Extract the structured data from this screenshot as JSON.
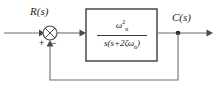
{
  "diagram": {
    "type": "control-block-diagram",
    "background_color": "#ffffff",
    "line_color": "#6e6e6e",
    "block_border_color": "#3c3c3c",
    "text_color": "#1d1d1d"
  },
  "signals": {
    "input_label": "R(s)",
    "output_label": "C(s)"
  },
  "summing_junction": {
    "name": "summing-junction",
    "style": "circle-with-cross",
    "input_sign": "+",
    "feedback_sign": "−",
    "center_x": 50,
    "center_y": 33,
    "radius": 7
  },
  "plant_block": {
    "name": "plant-transfer-function-block",
    "numerator_text": "ωn²",
    "denominator_text": "s(s+2ζωn)",
    "numerator": {
      "symbol": "ω",
      "superscript": "2",
      "subscript": "n"
    },
    "denominator": {
      "leading": "s(s+2",
      "zeta": "ζ",
      "omega": "ω",
      "omega_subscript": "n",
      "trailing": ")"
    },
    "transfer_function_plain": "ωn^2 / (s(s + 2ζωn))",
    "rect": {
      "x": 86,
      "y": 9,
      "width": 71,
      "height": 52
    }
  },
  "feedback_path": {
    "name": "unity-feedback-path",
    "gain": "1",
    "has_block": false,
    "takeoff_x": 178,
    "takeoff_y": 33,
    "bottom_y": 80,
    "return_x": 50
  },
  "wires": {
    "input_start_x": 4,
    "input_y": 33,
    "output_end_x": 214
  }
}
